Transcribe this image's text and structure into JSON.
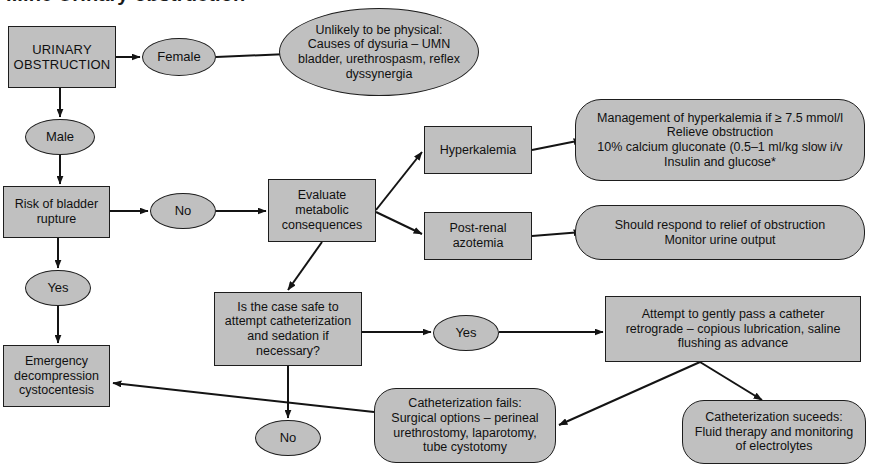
{
  "title": "...ine Urinary obstruction",
  "colors": {
    "node_fill": "#c0c0c0",
    "node_border": "#1d1d1d",
    "edge": "#141414",
    "text": "#101010",
    "background": "#ffffff"
  },
  "nodes": [
    {
      "id": "urinary_obstruction",
      "label": "URINARY\nOBSTRUCTION",
      "shape": "rect",
      "x": 8,
      "y": 26,
      "w": 108,
      "h": 62
    },
    {
      "id": "female",
      "label": "Female",
      "shape": "oval",
      "x": 142,
      "y": 38,
      "w": 74,
      "h": 38
    },
    {
      "id": "unlikely_physical",
      "label": "Unlikely to be physical:\nCauses of dysuria – UMN\nbladder, urethrospasm, reflex\ndyssynergia",
      "shape": "oval",
      "x": 279,
      "y": 8,
      "w": 200,
      "h": 88
    },
    {
      "id": "male",
      "label": "Male",
      "shape": "oval",
      "x": 25,
      "y": 119,
      "w": 70,
      "h": 36
    },
    {
      "id": "risk_bladder_rupture",
      "label": "Risk of bladder\nrupture",
      "shape": "rect",
      "x": 3,
      "y": 186,
      "w": 107,
      "h": 52
    },
    {
      "id": "no_rupture",
      "label": "No",
      "shape": "oval",
      "x": 150,
      "y": 193,
      "w": 66,
      "h": 36
    },
    {
      "id": "evaluate_metabolic",
      "label": "Evaluate\nmetabolic\nconsequences",
      "shape": "rect",
      "x": 268,
      "y": 179,
      "w": 108,
      "h": 63
    },
    {
      "id": "hyperkalemia",
      "label": "Hyperkalemia",
      "shape": "rect",
      "x": 424,
      "y": 126,
      "w": 108,
      "h": 48
    },
    {
      "id": "hyperkalemia_mgmt",
      "label": "Management of hyperkalemia if ≥ 7.5 mmol/l\nRelieve obstruction\n10% calcium gluconate (0.5–1 ml/kg slow i/v\nInsulin and glucose*",
      "shape": "round",
      "x": 575,
      "y": 99,
      "w": 290,
      "h": 82
    },
    {
      "id": "post_renal_azotemia",
      "label": "Post-renal\nazotemia",
      "shape": "rect",
      "x": 424,
      "y": 212,
      "w": 108,
      "h": 48
    },
    {
      "id": "should_respond",
      "label": "Should respond to relief of obstruction\nMonitor urine output",
      "shape": "round",
      "x": 575,
      "y": 205,
      "w": 290,
      "h": 55
    },
    {
      "id": "is_case_safe",
      "label": "Is the case safe to\nattempt catheterization\nand sedation if\nnecessary?",
      "shape": "rect",
      "x": 214,
      "y": 292,
      "w": 148,
      "h": 74
    },
    {
      "id": "yes_catheterize",
      "label": "Yes",
      "shape": "oval",
      "x": 433,
      "y": 315,
      "w": 66,
      "h": 36
    },
    {
      "id": "attempt_catheter",
      "label": "Attempt to gently pass a catheter\nretrograde – copious lubrication, saline\nflushing as advance",
      "shape": "rect",
      "x": 605,
      "y": 296,
      "w": 256,
      "h": 66
    },
    {
      "id": "no_catheterize",
      "label": "No",
      "shape": "oval",
      "x": 255,
      "y": 420,
      "w": 66,
      "h": 36
    },
    {
      "id": "emergency_decompression",
      "label": "Emergency\ndecompression\ncystocentesis",
      "shape": "rect",
      "x": 3,
      "y": 345,
      "w": 107,
      "h": 62
    },
    {
      "id": "yes_rupture",
      "label": "Yes",
      "shape": "oval",
      "x": 25,
      "y": 270,
      "w": 66,
      "h": 36
    },
    {
      "id": "catheterization_fails",
      "label": "Catheterization fails:\nSurgical options – perineal\nurethrostomy, laparotomy,\ntube cystotomy",
      "shape": "pill",
      "x": 374,
      "y": 388,
      "w": 182,
      "h": 75
    },
    {
      "id": "catheterization_succeeds",
      "label": "Catheterization suceeds:\nFluid therapy and monitoring\nof electrolytes",
      "shape": "pill",
      "x": 682,
      "y": 400,
      "w": 184,
      "h": 64
    }
  ],
  "edges": [
    {
      "id": "urinary-to-female",
      "from": "urinary_obstruction",
      "to": "female"
    },
    {
      "id": "female-to-unlikely",
      "from": "female",
      "to": "unlikely_physical"
    },
    {
      "id": "urinary-to-male",
      "from": "urinary_obstruction",
      "to": "male"
    },
    {
      "id": "male-to-risk",
      "from": "male",
      "to": "risk_bladder_rupture"
    },
    {
      "id": "risk-to-no",
      "from": "risk_bladder_rupture",
      "to": "no_rupture"
    },
    {
      "id": "no-to-evaluate",
      "from": "no_rupture",
      "to": "evaluate_metabolic"
    },
    {
      "id": "evaluate-to-hyperkalemia",
      "from": "evaluate_metabolic",
      "to": "hyperkalemia"
    },
    {
      "id": "evaluate-to-azotemia",
      "from": "evaluate_metabolic",
      "to": "post_renal_azotemia"
    },
    {
      "id": "hyperkalemia-to-mgmt",
      "from": "hyperkalemia",
      "to": "hyperkalemia_mgmt"
    },
    {
      "id": "azotemia-to-respond",
      "from": "post_renal_azotemia",
      "to": "should_respond"
    },
    {
      "id": "evaluate-to-is-case-safe",
      "from": "evaluate_metabolic",
      "to": "is_case_safe"
    },
    {
      "id": "is-case-safe-to-yes",
      "from": "is_case_safe",
      "to": "yes_catheterize"
    },
    {
      "id": "yes-to-attempt",
      "from": "yes_catheterize",
      "to": "attempt_catheter"
    },
    {
      "id": "is-case-safe-to-no",
      "from": "is_case_safe",
      "to": "no_catheterize"
    },
    {
      "id": "risk-to-yes",
      "from": "risk_bladder_rupture",
      "to": "yes_rupture"
    },
    {
      "id": "yes-to-emergency",
      "from": "yes_rupture",
      "to": "emergency_decompression"
    },
    {
      "id": "fails-to-emergency",
      "from": "catheterization_fails",
      "to": "emergency_decompression"
    },
    {
      "id": "attempt-to-succeeds",
      "from": "attempt_catheter",
      "to": "catheterization_succeeds"
    },
    {
      "id": "attempt-to-fails",
      "from": "attempt_catheter",
      "to": "catheterization_fails"
    }
  ]
}
